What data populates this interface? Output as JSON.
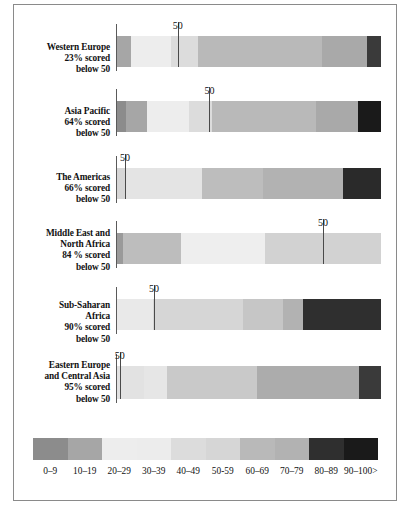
{
  "chart_data": {
    "type": "bar",
    "title": "",
    "subtitle": "",
    "xlabel": "",
    "ylabel": "",
    "orientation": "horizontal",
    "stacked": true,
    "normalized_percent": true,
    "xlim": [
      0,
      100
    ],
    "grid": false,
    "legend_position": "bottom",
    "categories": [
      "0–9",
      "10–19",
      "20–29",
      "30–39",
      "40–49",
      "50-59",
      "60–69",
      "70–79",
      "80–89",
      "90–100>"
    ],
    "category_colors": [
      "#8c8c8c",
      "#a6a6a6",
      "#ededed",
      "#ececec",
      "#dcdcdc",
      "#d6d6d6",
      "#b9b9b9",
      "#b2b2b2",
      "#2f2f2f",
      "#1a1a1a"
    ],
    "series": [
      {
        "name": "Western Europe",
        "label_lines": [
          "Western Europe",
          "23% scored",
          "below 50"
        ],
        "marker_value": 50,
        "marker_label": "50",
        "marker_position_percent": 23,
        "values": [
          0.0,
          3.8,
          11.4,
          0.0,
          7.6,
          0.0,
          34.8,
          12.9,
          0.0,
          3.8
        ],
        "value_colors": [
          "#8c8c8c",
          "#a6a6a6",
          "#ededed",
          "#ececec",
          "#dcdcdc",
          "#d6d6d6",
          "#b9b9b9",
          "#a9a9a9",
          "#2f2f2f",
          "#3a3a3a"
        ]
      },
      {
        "name": "Asia Pacific",
        "label_lines": [
          "Asia Pacific",
          "64% scored",
          "below 50"
        ],
        "marker_value": 50,
        "marker_label": "50",
        "marker_position_percent": 35,
        "values": [
          3.0,
          6.8,
          13.6,
          0.0,
          7.6,
          0.0,
          34.1,
          13.6,
          0.0,
          7.6
        ],
        "value_colors": [
          "#8c8c8c",
          "#a6a6a6",
          "#ededed",
          "#ececec",
          "#dcdcdc",
          "#d6d6d6",
          "#b9b9b9",
          "#a9a9a9",
          "#2f2f2f",
          "#1a1a1a"
        ]
      },
      {
        "name": "The Americas",
        "label_lines": [
          "The Americas",
          "66% scored",
          "below 50"
        ],
        "marker_value": 50,
        "marker_label": "50",
        "marker_position_percent": 3,
        "values": [
          0.0,
          3.0,
          24.2,
          0.0,
          0.0,
          19.7,
          0.0,
          25.8,
          0.0,
          12.1
        ],
        "value_colors": [
          "#8c8c8c",
          "#d6d6d6",
          "#e4e4e4",
          "#ececec",
          "#dcdcdc",
          "#bdbdbd",
          "#b9b9b9",
          "#b2b2b2",
          "#2f2f2f",
          "#2a2a2a"
        ]
      },
      {
        "name": "Middle East and North Africa",
        "label_lines": [
          "Middle East and",
          "North Africa",
          "84 % scored",
          "below 50"
        ],
        "marker_value": 50,
        "marker_label": "50",
        "marker_position_percent": 78,
        "values": [
          2.3,
          22.0,
          0.0,
          31.8,
          0.0,
          0.0,
          0.0,
          43.9,
          0.0,
          0.0
        ],
        "value_colors": [
          "#9a9a9a",
          "#bdbdbd",
          "#ededed",
          "#eeeeee",
          "#dcdcdc",
          "#d6d6d6",
          "#d2d2d2",
          "#d2d2d2",
          "#2f2f2f",
          "#1a1a1a"
        ]
      },
      {
        "name": "Sub-Saharan Africa",
        "label_lines": [
          "Sub-Saharan",
          "Africa",
          "90% scored",
          "below 50"
        ],
        "marker_value": 50,
        "marker_label": "50",
        "marker_position_percent": 14,
        "values": [
          0.0,
          0.0,
          13.6,
          0.0,
          34.1,
          0.0,
          15.2,
          7.6,
          29.5,
          0.0
        ],
        "value_colors": [
          "#8c8c8c",
          "#a6a6a6",
          "#e9e9e9",
          "#ececec",
          "#d6d6d6",
          "#d6d6d6",
          "#c6c6c6",
          "#b2b2b2",
          "#2f2f2f",
          "#1a1a1a"
        ]
      },
      {
        "name": "Eastern Europe and Central Asia",
        "label_lines": [
          "Eastern Europe",
          "and Central Asia",
          "95% scored",
          "below 50"
        ],
        "marker_value": 50,
        "marker_label": "50",
        "marker_position_percent": 1,
        "values": [
          0.0,
          0.0,
          9.8,
          8.0,
          0.0,
          32.2,
          0.0,
          36.4,
          8.0,
          0.0
        ],
        "value_colors": [
          "#8c8c8c",
          "#a6a6a6",
          "#e2e2e2",
          "#e6e6e6",
          "#dcdcdc",
          "#c9c9c9",
          "#b9b9b9",
          "#acacac",
          "#3a3a3a",
          "#1a1a1a"
        ]
      }
    ]
  },
  "legend": {
    "labels": [
      "0–9",
      "10–19",
      "20–29",
      "30–39",
      "40–49",
      "50-59",
      "60–69",
      "70–79",
      "80–89",
      "90–100>"
    ],
    "colors": [
      "#8c8c8c",
      "#a6a6a6",
      "#ededed",
      "#ececec",
      "#dcdcdc",
      "#d6d6d6",
      "#b9b9b9",
      "#b2b2b2",
      "#2f2f2f",
      "#1a1a1a"
    ]
  },
  "layout": {
    "row_tops": [
      36,
      101,
      168,
      233,
      299,
      366
    ],
    "row_heights": [
      31,
      31,
      31,
      31,
      31,
      33
    ],
    "label_tops": [
      42,
      106,
      172,
      228,
      300,
      360
    ],
    "tick_label_tops": [
      20,
      85,
      152,
      217,
      283,
      350
    ]
  }
}
